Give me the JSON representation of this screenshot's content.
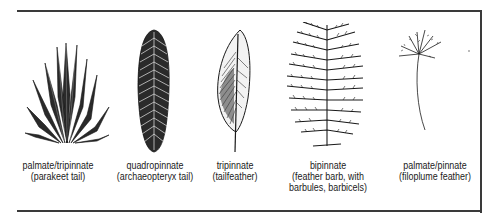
{
  "figure": {
    "panels": [
      {
        "name": "palmate-tripinnate",
        "line1": "palmate/tripinnate",
        "line2": "(parakeet tail)",
        "line3": ""
      },
      {
        "name": "quadropinnate",
        "line1": "quadropinnate",
        "line2": "(archaeopteryx tail)",
        "line3": ""
      },
      {
        "name": "tripinnate",
        "line1": "tripinnate",
        "line2": "(tailfeather)",
        "line3": ""
      },
      {
        "name": "bipinnate",
        "line1": "bipinnate",
        "line2": "(feather barb, with",
        "line3": "barbules, barbicels)"
      },
      {
        "name": "palmate-pinnate",
        "line1": "palmate/pinnate",
        "line2": "(filoplume feather)",
        "line3": ""
      }
    ],
    "colors": {
      "ink": "#1a1a1a",
      "frame": "#3a3a3a",
      "background": "#ffffff"
    }
  }
}
